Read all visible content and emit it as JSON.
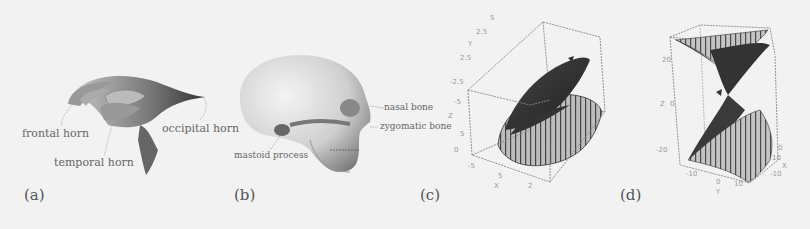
{
  "figure": {
    "background": "#f2f2f2",
    "panels": [
      {
        "id": "a",
        "letter": "(a)",
        "subject": "brain ventricles",
        "annotations": [
          "frontal horn",
          "occipital horn",
          "temporal horn"
        ]
      },
      {
        "id": "b",
        "letter": "(b)",
        "subject": "skull",
        "annotations": [
          "nasal bone",
          "zygomatic bone",
          "mastoid process"
        ]
      },
      {
        "id": "c",
        "letter": "(c)",
        "subject": "3d surface plot",
        "ticks": [
          "2.5",
          "5",
          "2.5",
          "-2.5",
          "-5",
          "5",
          "0",
          "0",
          "-5",
          "5",
          "2",
          "0"
        ],
        "axis_labels": [
          "Y",
          "Z",
          "X"
        ]
      },
      {
        "id": "d",
        "letter": "(d)",
        "subject": "3d surface plot",
        "ticks": [
          "20",
          "0",
          "-20",
          "-10",
          "0",
          "10",
          "-10",
          "10",
          "0"
        ],
        "axis_labels": [
          "Z",
          "Y",
          "X"
        ]
      }
    ]
  }
}
